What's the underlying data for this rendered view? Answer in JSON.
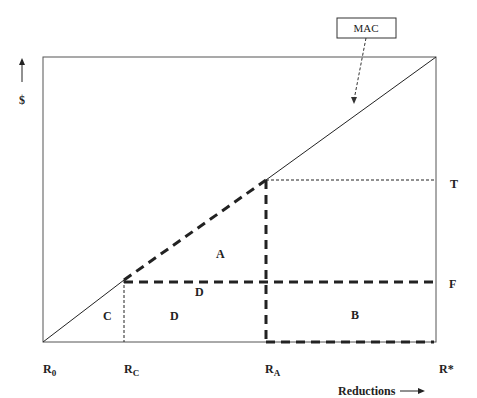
{
  "diagram": {
    "callout": {
      "label": "MAC"
    },
    "axes": {
      "y_label": "$",
      "x_label": "Reductions"
    },
    "x_ticks": [
      {
        "main": "R",
        "sub": "0"
      },
      {
        "main": "R",
        "sub": "C"
      },
      {
        "main": "R",
        "sub": "A"
      },
      {
        "main": "R",
        "sub": "*"
      }
    ],
    "right_labels": {
      "T": "T",
      "F": "F"
    },
    "regions": {
      "A": "A",
      "B": "B",
      "C": "C",
      "D_upper": "D",
      "D_lower": "D"
    },
    "colors": {
      "line": "#222222",
      "frame": "#555555",
      "background": "#ffffff"
    }
  }
}
